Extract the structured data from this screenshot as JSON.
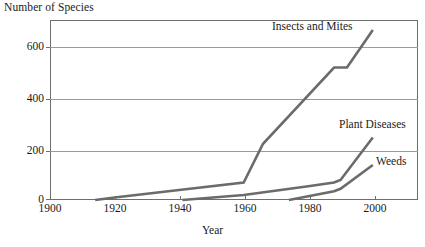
{
  "chart_data": {
    "type": "line",
    "title": "",
    "ylabel": "Number of Species",
    "xlabel": "Year",
    "xlim": [
      1900,
      2014
    ],
    "ylim": [
      0,
      720
    ],
    "grid": true,
    "legend_position": "inline-annotations",
    "xticks": [
      1900,
      1920,
      1940,
      1960,
      1980,
      2000
    ],
    "xtick_labels": [
      "1900",
      "1920",
      "1940",
      "1960",
      "1980",
      "2000"
    ],
    "yticks": [
      0,
      200,
      400,
      600
    ],
    "ytick_labels": [
      "0",
      "200",
      "400",
      "600"
    ],
    "gridline_values": [
      200,
      400,
      600
    ],
    "line_color": "#6b6b6b",
    "axis_color": "#6e6e6e",
    "series": [
      {
        "name": "Insects and Mites",
        "label": "Insects and Mites",
        "x": [
          1914,
          1920,
          1940,
          1960,
          1966,
          1988,
          1992,
          2000
        ],
        "values": [
          0,
          10,
          40,
          70,
          225,
          530,
          530,
          680
        ]
      },
      {
        "name": "Plant Diseases",
        "label": "Plant Diseases",
        "x": [
          1941,
          1960,
          1980,
          1988,
          1990,
          2000
        ],
        "values": [
          0,
          20,
          55,
          70,
          80,
          250
        ]
      },
      {
        "name": "Weeds",
        "label": "Weeds",
        "x": [
          1974,
          1980,
          1988,
          1990,
          2000
        ],
        "values": [
          0,
          15,
          35,
          45,
          140
        ]
      }
    ]
  },
  "axes": {
    "y_caption": "Number of Species",
    "x_title": "Year",
    "ytick_labels": [
      "600",
      "400",
      "200",
      "0"
    ],
    "xtick_labels": [
      "1900",
      "1920",
      "1940",
      "1960",
      "1980",
      "2000"
    ]
  },
  "annotations": {
    "insects_label": "Insects and Mites",
    "plant_diseases_label": "Plant Diseases",
    "weeds_label": "Weeds"
  }
}
